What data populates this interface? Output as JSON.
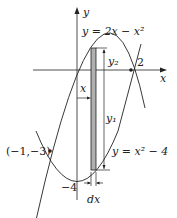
{
  "diagram": {
    "type": "area-between-curves",
    "axes": {
      "x_label": "x",
      "y_label": "y"
    },
    "curves": [
      {
        "name": "upper",
        "equation_label": "y = 2x − x²"
      },
      {
        "name": "lower",
        "equation_label": "y = x² − 4"
      }
    ],
    "labels": {
      "intersection_right": "2",
      "intersection_left": "(−1,−3)",
      "y_intercept_lower": "−4",
      "strip_x": "x",
      "strip_y1": "y₁",
      "strip_y2": "y₂",
      "strip_width": "dx"
    },
    "colors": {
      "strip_fill": "#b0b0b0",
      "line": "#222222"
    }
  }
}
